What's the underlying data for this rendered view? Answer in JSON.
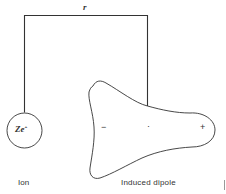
{
  "diagram": {
    "distance_label": "r",
    "ion": {
      "symbol": "Ze",
      "charge_superscript": "+",
      "caption": "Ion"
    },
    "dipole": {
      "negative_sign": "−",
      "center_mark": "·",
      "positive_sign": "+",
      "caption": "Induced dipole"
    },
    "colors": {
      "stroke": "#333333",
      "background": "#ffffff"
    }
  }
}
